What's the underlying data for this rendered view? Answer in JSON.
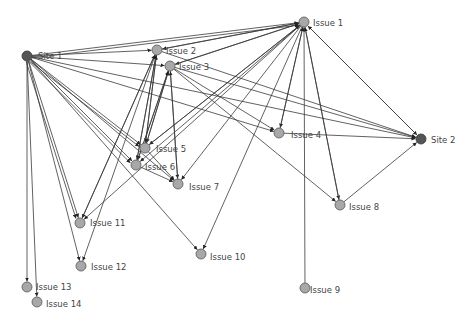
{
  "colors": {
    "edge": "#3a3a3a",
    "issue_node": "#a8a8a8",
    "site_node": "#555555",
    "label": "#444444",
    "background": "#ffffff"
  },
  "nodes": [
    {
      "id": "site1",
      "label": "Site 1",
      "type": "site",
      "x": 27,
      "y": 56,
      "lx": 38,
      "ly": 59
    },
    {
      "id": "site2",
      "label": "Site 2",
      "type": "site",
      "x": 421,
      "y": 139,
      "lx": 431,
      "ly": 143
    },
    {
      "id": "issue1",
      "label": "Issue 1",
      "type": "issue",
      "x": 304,
      "y": 22,
      "lx": 313,
      "ly": 26
    },
    {
      "id": "issue2",
      "label": "Issue 2",
      "type": "issue",
      "x": 157,
      "y": 50,
      "lx": 166,
      "ly": 54
    },
    {
      "id": "issue3",
      "label": "Issue 3",
      "type": "issue",
      "x": 170,
      "y": 66,
      "lx": 179,
      "ly": 70
    },
    {
      "id": "issue4",
      "label": "Issue 4",
      "type": "issue",
      "x": 279,
      "y": 133,
      "lx": 291,
      "ly": 138
    },
    {
      "id": "issue5",
      "label": "Issue 5",
      "type": "issue",
      "x": 145,
      "y": 148,
      "lx": 156,
      "ly": 152
    },
    {
      "id": "issue6",
      "label": "Issue 6",
      "type": "issue",
      "x": 136,
      "y": 165,
      "lx": 145,
      "ly": 170
    },
    {
      "id": "issue7",
      "label": "Issue 7",
      "type": "issue",
      "x": 178,
      "y": 184,
      "lx": 189,
      "ly": 190
    },
    {
      "id": "issue8",
      "label": "Issue 8",
      "type": "issue",
      "x": 340,
      "y": 205,
      "lx": 349,
      "ly": 210
    },
    {
      "id": "issue9",
      "label": "Issue 9",
      "type": "issue",
      "x": 305,
      "y": 288,
      "lx": 310,
      "ly": 293
    },
    {
      "id": "issue10",
      "label": "Issue 10",
      "type": "issue",
      "x": 201,
      "y": 254,
      "lx": 210,
      "ly": 260
    },
    {
      "id": "issue11",
      "label": "Issue 11",
      "type": "issue",
      "x": 80,
      "y": 223,
      "lx": 90,
      "ly": 226
    },
    {
      "id": "issue12",
      "label": "Issue 12",
      "type": "issue",
      "x": 81,
      "y": 266,
      "lx": 91,
      "ly": 270
    },
    {
      "id": "issue13",
      "label": "Issue 13",
      "type": "issue",
      "x": 27,
      "y": 287,
      "lx": 36,
      "ly": 290
    },
    {
      "id": "issue14",
      "label": "Issue 14",
      "type": "issue",
      "x": 37,
      "y": 302,
      "lx": 46,
      "ly": 307
    }
  ],
  "edges": [
    [
      "site1",
      "issue1"
    ],
    [
      "site1",
      "issue1"
    ],
    [
      "site1",
      "issue2"
    ],
    [
      "site1",
      "issue3"
    ],
    [
      "site1",
      "issue4"
    ],
    [
      "site1",
      "site2"
    ],
    [
      "site1",
      "issue5"
    ],
    [
      "site1",
      "issue5"
    ],
    [
      "site1",
      "issue6"
    ],
    [
      "site1",
      "issue6"
    ],
    [
      "site1",
      "issue7"
    ],
    [
      "site1",
      "issue10"
    ],
    [
      "site1",
      "issue11"
    ],
    [
      "site1",
      "issue11"
    ],
    [
      "site1",
      "issue12"
    ],
    [
      "site1",
      "issue13"
    ],
    [
      "site1",
      "issue14"
    ],
    [
      "issue1",
      "issue2"
    ],
    [
      "issue1",
      "issue3"
    ],
    [
      "issue1",
      "issue4"
    ],
    [
      "issue1",
      "issue5"
    ],
    [
      "issue1",
      "issue6"
    ],
    [
      "issue1",
      "issue7"
    ],
    [
      "issue1",
      "issue8"
    ],
    [
      "issue1",
      "site2"
    ],
    [
      "issue1",
      "issue10"
    ],
    [
      "issue1",
      "issue11"
    ],
    [
      "issue9",
      "issue1"
    ],
    [
      "site2",
      "issue1"
    ],
    [
      "issue8",
      "issue1"
    ],
    [
      "issue2",
      "issue5"
    ],
    [
      "issue2",
      "issue6"
    ],
    [
      "issue2",
      "issue11"
    ],
    [
      "issue2",
      "issue12"
    ],
    [
      "issue2",
      "site2"
    ],
    [
      "issue5",
      "issue2"
    ],
    [
      "issue6",
      "issue2"
    ],
    [
      "issue11",
      "issue2"
    ],
    [
      "issue3",
      "issue5"
    ],
    [
      "issue3",
      "issue6"
    ],
    [
      "issue3",
      "issue7"
    ],
    [
      "issue3",
      "issue4"
    ],
    [
      "issue3",
      "site2"
    ],
    [
      "issue5",
      "issue3"
    ],
    [
      "issue7",
      "issue3"
    ],
    [
      "issue6",
      "issue3"
    ],
    [
      "issue4",
      "site2"
    ],
    [
      "issue5",
      "issue7"
    ],
    [
      "issue6",
      "issue7"
    ],
    [
      "issue8",
      "site2"
    ],
    [
      "issue3",
      "issue8"
    ],
    [
      "issue2",
      "issue1"
    ],
    [
      "issue3",
      "issue1"
    ],
    [
      "issue4",
      "issue1"
    ],
    [
      "issue5",
      "issue1"
    ]
  ]
}
